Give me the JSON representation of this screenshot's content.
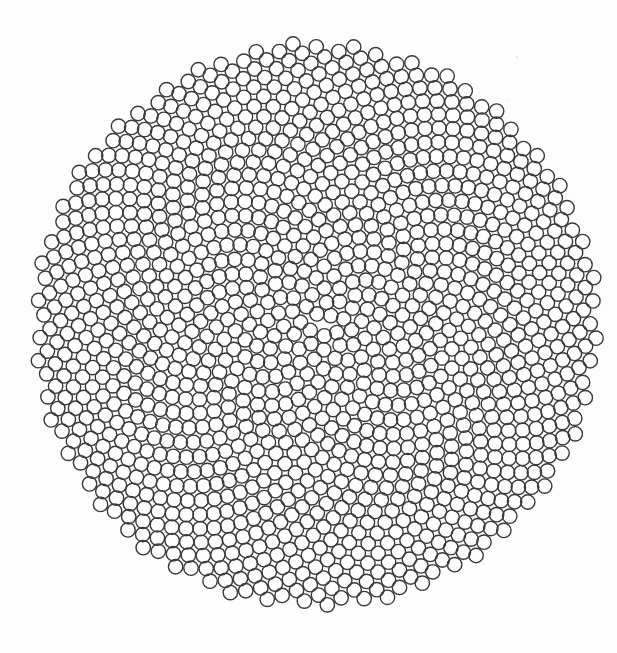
{
  "figure": {
    "type": "phyllotaxis-circle-packing",
    "width": 617,
    "height": 653,
    "background": "#ffffff",
    "center": {
      "x": 316,
      "y": 325
    },
    "outer_radius": 282,
    "circle_radius": 7.2,
    "spacing_c": 7.85,
    "count": 1290,
    "golden_angle_deg": 137.508,
    "stroke_color": "#3a3a3a",
    "stroke_width": 1.4
  },
  "specks": [
    {
      "x": 517,
      "y": 57,
      "r": 0.8
    },
    {
      "x": 509,
      "y": 100,
      "r": 0.6
    }
  ]
}
